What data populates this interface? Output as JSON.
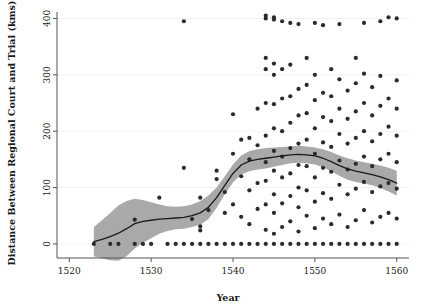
{
  "chart_data": {
    "type": "scatter",
    "title": "",
    "xlabel": "Year",
    "ylabel": "Distance Between Regional Court and Trial (kms)",
    "xlim": [
      1518.5,
      1561.5
    ],
    "ylim": [
      -25,
      415
    ],
    "xticks": [
      1520,
      1530,
      1540,
      1550,
      1560
    ],
    "xtick_labels": [
      "1520",
      "1530",
      "1540",
      "1550",
      "1560"
    ],
    "yticks": [
      0,
      100,
      200,
      300,
      400
    ],
    "ytick_labels": [
      "0",
      "100",
      "200",
      "300",
      "400"
    ],
    "grid": true,
    "grid_axis": "y",
    "legend": "none",
    "point_color": "#2b2b2b",
    "point_size": 2.1,
    "line_color": "#1a1a1a",
    "band_color": "#a9a9a9",
    "band_label": "confidence band",
    "line_label": "loess trend",
    "series": [
      {
        "name": "Trials",
        "points": [
          [
            1523,
            0
          ],
          [
            1525,
            0
          ],
          [
            1526,
            0
          ],
          [
            1528,
            43
          ],
          [
            1528,
            0
          ],
          [
            1529,
            0
          ],
          [
            1530,
            0
          ],
          [
            1531,
            82
          ],
          [
            1532,
            0
          ],
          [
            1533,
            0
          ],
          [
            1534,
            395
          ],
          [
            1534,
            135
          ],
          [
            1534,
            0
          ],
          [
            1535,
            0
          ],
          [
            1535,
            44
          ],
          [
            1536,
            0
          ],
          [
            1536,
            24
          ],
          [
            1536,
            31
          ],
          [
            1536,
            82
          ],
          [
            1537,
            0
          ],
          [
            1537,
            60
          ],
          [
            1538,
            0
          ],
          [
            1538,
            115
          ],
          [
            1538,
            130
          ],
          [
            1539,
            0
          ],
          [
            1539,
            55
          ],
          [
            1539,
            92
          ],
          [
            1540,
            0
          ],
          [
            1540,
            70
          ],
          [
            1540,
            160
          ],
          [
            1540,
            230
          ],
          [
            1541,
            0
          ],
          [
            1541,
            48
          ],
          [
            1541,
            120
          ],
          [
            1541,
            185
          ],
          [
            1542,
            0
          ],
          [
            1542,
            35
          ],
          [
            1542,
            95
          ],
          [
            1542,
            150
          ],
          [
            1542,
            188
          ],
          [
            1543,
            0
          ],
          [
            1543,
            62
          ],
          [
            1543,
            108
          ],
          [
            1543,
            175
          ],
          [
            1543,
            240
          ],
          [
            1544,
            0
          ],
          [
            1544,
            25
          ],
          [
            1544,
            70
          ],
          [
            1544,
            112
          ],
          [
            1544,
            145
          ],
          [
            1544,
            192
          ],
          [
            1544,
            250
          ],
          [
            1544,
            310
          ],
          [
            1544,
            330
          ],
          [
            1544,
            400
          ],
          [
            1544,
            405
          ],
          [
            1545,
            0
          ],
          [
            1545,
            18
          ],
          [
            1545,
            55
          ],
          [
            1545,
            88
          ],
          [
            1545,
            130
          ],
          [
            1545,
            165
          ],
          [
            1545,
            205
          ],
          [
            1545,
            248
          ],
          [
            1545,
            300
          ],
          [
            1545,
            320
          ],
          [
            1545,
            398
          ],
          [
            1545,
            402
          ],
          [
            1546,
            0
          ],
          [
            1546,
            30
          ],
          [
            1546,
            72
          ],
          [
            1546,
            118
          ],
          [
            1546,
            155
          ],
          [
            1546,
            200
          ],
          [
            1546,
            258
          ],
          [
            1546,
            310
          ],
          [
            1546,
            395
          ],
          [
            1547,
            0
          ],
          [
            1547,
            40
          ],
          [
            1547,
            85
          ],
          [
            1547,
            125
          ],
          [
            1547,
            170
          ],
          [
            1547,
            215
          ],
          [
            1547,
            262
          ],
          [
            1547,
            318
          ],
          [
            1547,
            392
          ],
          [
            1548,
            0
          ],
          [
            1548,
            22
          ],
          [
            1548,
            65
          ],
          [
            1548,
            100
          ],
          [
            1548,
            140
          ],
          [
            1548,
            178
          ],
          [
            1548,
            228
          ],
          [
            1548,
            275
          ],
          [
            1548,
            390
          ],
          [
            1549,
            0
          ],
          [
            1549,
            50
          ],
          [
            1549,
            95
          ],
          [
            1549,
            138
          ],
          [
            1549,
            185
          ],
          [
            1549,
            232
          ],
          [
            1549,
            282
          ],
          [
            1549,
            330
          ],
          [
            1550,
            0
          ],
          [
            1550,
            28
          ],
          [
            1550,
            75
          ],
          [
            1550,
            118
          ],
          [
            1550,
            160
          ],
          [
            1550,
            205
          ],
          [
            1550,
            255
          ],
          [
            1550,
            300
          ],
          [
            1550,
            392
          ],
          [
            1551,
            0
          ],
          [
            1551,
            45
          ],
          [
            1551,
            90
          ],
          [
            1551,
            135
          ],
          [
            1551,
            180
          ],
          [
            1551,
            225
          ],
          [
            1551,
            268
          ],
          [
            1551,
            388
          ],
          [
            1552,
            0
          ],
          [
            1552,
            35
          ],
          [
            1552,
            80
          ],
          [
            1552,
            128
          ],
          [
            1552,
            172
          ],
          [
            1552,
            218
          ],
          [
            1552,
            262
          ],
          [
            1552,
            310
          ],
          [
            1553,
            0
          ],
          [
            1553,
            52
          ],
          [
            1553,
            105
          ],
          [
            1553,
            148
          ],
          [
            1553,
            195
          ],
          [
            1553,
            240
          ],
          [
            1553,
            292
          ],
          [
            1553,
            390
          ],
          [
            1554,
            0
          ],
          [
            1554,
            30
          ],
          [
            1554,
            88
          ],
          [
            1554,
            132
          ],
          [
            1554,
            178
          ],
          [
            1554,
            222
          ],
          [
            1554,
            272
          ],
          [
            1555,
            0
          ],
          [
            1555,
            42
          ],
          [
            1555,
            98
          ],
          [
            1555,
            142
          ],
          [
            1555,
            188
          ],
          [
            1555,
            235
          ],
          [
            1555,
            285
          ],
          [
            1555,
            330
          ],
          [
            1556,
            0
          ],
          [
            1556,
            60
          ],
          [
            1556,
            110
          ],
          [
            1556,
            155
          ],
          [
            1556,
            200
          ],
          [
            1556,
            250
          ],
          [
            1556,
            302
          ],
          [
            1556,
            392
          ],
          [
            1557,
            0
          ],
          [
            1557,
            38
          ],
          [
            1557,
            92
          ],
          [
            1557,
            138
          ],
          [
            1557,
            182
          ],
          [
            1557,
            228
          ],
          [
            1557,
            278
          ],
          [
            1558,
            0
          ],
          [
            1558,
            48
          ],
          [
            1558,
            102
          ],
          [
            1558,
            150
          ],
          [
            1558,
            195
          ],
          [
            1558,
            245
          ],
          [
            1558,
            298
          ],
          [
            1558,
            395
          ],
          [
            1559,
            0
          ],
          [
            1559,
            55
          ],
          [
            1559,
            108
          ],
          [
            1559,
            160
          ],
          [
            1559,
            208
          ],
          [
            1559,
            258
          ],
          [
            1559,
            402
          ],
          [
            1560,
            0
          ],
          [
            1560,
            45
          ],
          [
            1560,
            98
          ],
          [
            1560,
            145
          ],
          [
            1560,
            192
          ],
          [
            1560,
            240
          ],
          [
            1560,
            290
          ],
          [
            1560,
            400
          ]
        ]
      }
    ],
    "trend_line": [
      [
        1523,
        4
      ],
      [
        1524,
        8
      ],
      [
        1525,
        13
      ],
      [
        1526,
        19
      ],
      [
        1527,
        27
      ],
      [
        1528,
        36
      ],
      [
        1529,
        40
      ],
      [
        1530,
        42
      ],
      [
        1531,
        44
      ],
      [
        1532,
        45
      ],
      [
        1533,
        46
      ],
      [
        1534,
        47
      ],
      [
        1535,
        50
      ],
      [
        1536,
        55
      ],
      [
        1537,
        65
      ],
      [
        1538,
        82
      ],
      [
        1539,
        104
      ],
      [
        1540,
        125
      ],
      [
        1541,
        140
      ],
      [
        1542,
        147
      ],
      [
        1543,
        150
      ],
      [
        1544,
        152
      ],
      [
        1545,
        154
      ],
      [
        1546,
        156
      ],
      [
        1547,
        158
      ],
      [
        1548,
        159
      ],
      [
        1549,
        158
      ],
      [
        1550,
        156
      ],
      [
        1551,
        152
      ],
      [
        1552,
        146
      ],
      [
        1553,
        139
      ],
      [
        1554,
        133
      ],
      [
        1555,
        129
      ],
      [
        1556,
        126
      ],
      [
        1557,
        123
      ],
      [
        1558,
        119
      ],
      [
        1559,
        114
      ],
      [
        1560,
        108
      ]
    ],
    "band_upper": [
      [
        1523,
        30
      ],
      [
        1524,
        42
      ],
      [
        1525,
        55
      ],
      [
        1526,
        68
      ],
      [
        1527,
        76
      ],
      [
        1528,
        80
      ],
      [
        1529,
        78
      ],
      [
        1530,
        74
      ],
      [
        1531,
        70
      ],
      [
        1532,
        67
      ],
      [
        1533,
        66
      ],
      [
        1534,
        67
      ],
      [
        1535,
        70
      ],
      [
        1536,
        76
      ],
      [
        1537,
        86
      ],
      [
        1538,
        100
      ],
      [
        1539,
        120
      ],
      [
        1540,
        141
      ],
      [
        1541,
        157
      ],
      [
        1542,
        165
      ],
      [
        1543,
        168
      ],
      [
        1544,
        170
      ],
      [
        1545,
        171
      ],
      [
        1546,
        172
      ],
      [
        1547,
        173
      ],
      [
        1548,
        174
      ],
      [
        1549,
        173
      ],
      [
        1550,
        171
      ],
      [
        1551,
        168
      ],
      [
        1552,
        163
      ],
      [
        1553,
        157
      ],
      [
        1554,
        152
      ],
      [
        1555,
        148
      ],
      [
        1556,
        145
      ],
      [
        1557,
        142
      ],
      [
        1558,
        139
      ],
      [
        1559,
        135
      ],
      [
        1560,
        130
      ]
    ],
    "band_lower": [
      [
        1523,
        -22
      ],
      [
        1524,
        -26
      ],
      [
        1525,
        -29
      ],
      [
        1526,
        -30
      ],
      [
        1527,
        -22
      ],
      [
        1528,
        -8
      ],
      [
        1529,
        2
      ],
      [
        1530,
        10
      ],
      [
        1531,
        18
      ],
      [
        1532,
        23
      ],
      [
        1533,
        26
      ],
      [
        1534,
        27
      ],
      [
        1535,
        30
      ],
      [
        1536,
        34
      ],
      [
        1537,
        44
      ],
      [
        1538,
        64
      ],
      [
        1539,
        88
      ],
      [
        1540,
        109
      ],
      [
        1541,
        123
      ],
      [
        1542,
        129
      ],
      [
        1543,
        132
      ],
      [
        1544,
        134
      ],
      [
        1545,
        137
      ],
      [
        1546,
        140
      ],
      [
        1547,
        143
      ],
      [
        1548,
        144
      ],
      [
        1549,
        143
      ],
      [
        1550,
        141
      ],
      [
        1551,
        136
      ],
      [
        1552,
        129
      ],
      [
        1553,
        121
      ],
      [
        1554,
        114
      ],
      [
        1555,
        110
      ],
      [
        1556,
        107
      ],
      [
        1557,
        104
      ],
      [
        1558,
        99
      ],
      [
        1559,
        93
      ],
      [
        1560,
        86
      ]
    ]
  }
}
